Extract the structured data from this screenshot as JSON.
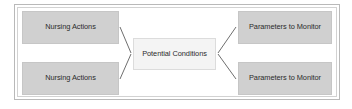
{
  "diagram": {
    "frame": {
      "outer_border_color": "#b9b9b9",
      "inner_border_color": "#d2d2d2",
      "background": "#ffffff"
    },
    "nodes": [
      {
        "id": "nursing-actions-1",
        "label": "Nursing Actions",
        "column": "left",
        "row": "top",
        "fill": "#d0d0d0",
        "border": "#c6c6c6",
        "text_color": "#2b2b2b"
      },
      {
        "id": "nursing-actions-2",
        "label": "Nursing Actions",
        "column": "left",
        "row": "bottom",
        "fill": "#d0d0d0",
        "border": "#c6c6c6",
        "text_color": "#2b2b2b"
      },
      {
        "id": "potential-conditions",
        "label": "Potential Conditions",
        "column": "center",
        "row": "middle",
        "fill": "#f4f4f4",
        "border": "#dcdcdc",
        "text_color": "#2b2b2b"
      },
      {
        "id": "parameters-to-monitor-1",
        "label": "Parameters to Monitor",
        "column": "right",
        "row": "top",
        "fill": "#d0d0d0",
        "border": "#c6c6c6",
        "text_color": "#2b2b2b"
      },
      {
        "id": "parameters-to-monitor-2",
        "label": "Parameters to Monitor",
        "column": "right",
        "row": "bottom",
        "fill": "#d0d0d0",
        "border": "#c6c6c6",
        "text_color": "#2b2b2b"
      }
    ],
    "connectors": [
      {
        "id": "connector-nursing-1-to-center",
        "from": "nursing-actions-1",
        "to": "potential-conditions",
        "color": "#6f6f6f"
      },
      {
        "id": "connector-nursing-2-to-center",
        "from": "nursing-actions-2",
        "to": "potential-conditions",
        "color": "#6f6f6f"
      },
      {
        "id": "connector-center-to-parameters-1",
        "from": "potential-conditions",
        "to": "parameters-to-monitor-1",
        "color": "#6f6f6f"
      },
      {
        "id": "connector-center-to-parameters-2",
        "from": "potential-conditions",
        "to": "parameters-to-monitor-2",
        "color": "#6f6f6f"
      }
    ]
  }
}
